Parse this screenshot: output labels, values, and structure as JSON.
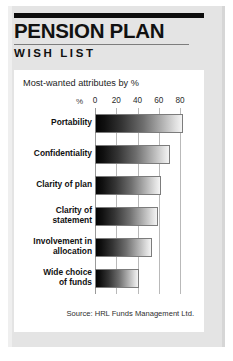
{
  "title": {
    "main": "PENSION PLAN",
    "sub": "WISH LIST"
  },
  "panel": {
    "caption": "Most-wanted attributes by %",
    "source": "Source: HRL Funds Management Ltd."
  },
  "axis": {
    "unit_label": "%"
  },
  "colors": {
    "card_background": "#e4e4e4",
    "panel_background": "#ffffff",
    "rule": "#0d0d0d",
    "gridline": "#b9b9b9",
    "bar_dark": "#040404",
    "bar_light": "#f4f4f4",
    "text": "#111111"
  },
  "chart_data": {
    "type": "bar",
    "orientation": "horizontal",
    "title": "Most-wanted attributes by %",
    "subtitle": "",
    "xlabel": "%",
    "ylabel": "",
    "xlim": [
      0,
      85
    ],
    "ticks": [
      0,
      20,
      40,
      60,
      80
    ],
    "tick_labels": [
      "0",
      "20",
      "40",
      "60",
      "80"
    ],
    "grid": true,
    "legend": false,
    "source": "Source: HRL Funds Management Ltd.",
    "categories": [
      "Portability",
      "Confidentiality",
      "Clarity of plan",
      "Clarity of statement",
      "Involvement in allocation",
      "Wide choice of funds"
    ],
    "values": [
      83,
      71,
      62,
      59,
      54,
      41
    ],
    "series": [
      {
        "name": "Most-wanted attributes",
        "values": [
          83,
          71,
          62,
          59,
          54,
          41
        ]
      }
    ]
  }
}
